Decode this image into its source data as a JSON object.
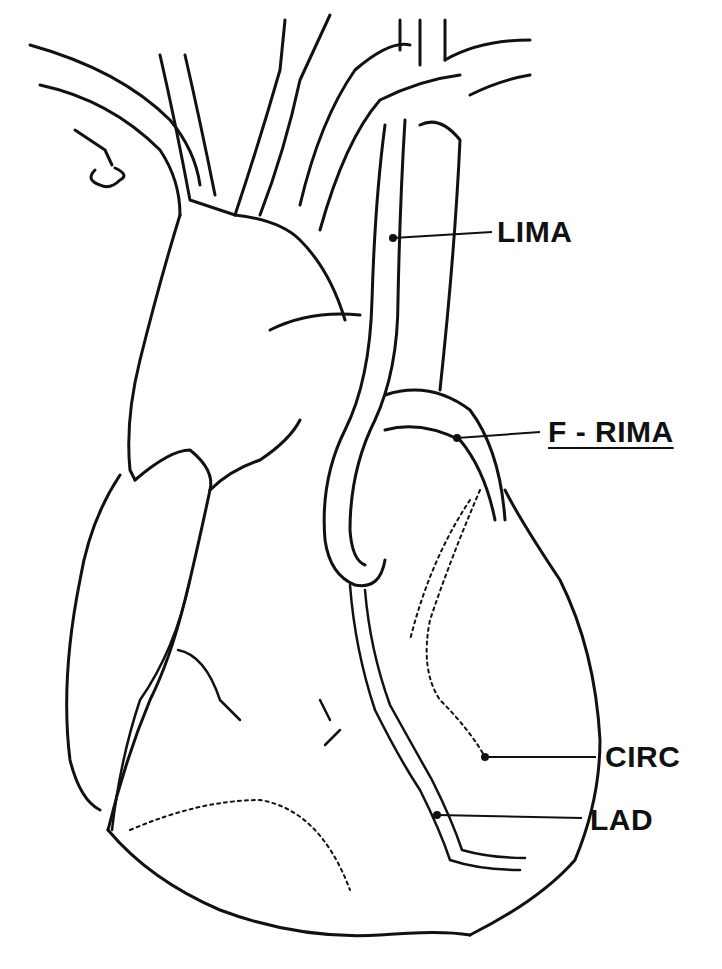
{
  "figure": {
    "type": "anatomical line drawing",
    "ink_color": "#111111",
    "background_color": "#ffffff"
  },
  "labels": [
    {
      "id": "lima",
      "text": "LIMA",
      "underlined": false,
      "leader_from": [
        393,
        238
      ],
      "leader_to": [
        492,
        232
      ]
    },
    {
      "id": "f_rima",
      "text": "F - RIMA",
      "underlined": true,
      "leader_from": [
        457,
        438
      ],
      "leader_to": [
        540,
        432
      ]
    },
    {
      "id": "circ",
      "text": "CIRC",
      "underlined": false,
      "leader_from": [
        485,
        757
      ],
      "leader_to": [
        596,
        757
      ]
    },
    {
      "id": "lad",
      "text": "LAD",
      "underlined": false,
      "leader_from": [
        437,
        815
      ],
      "leader_to": [
        582,
        818
      ]
    }
  ]
}
